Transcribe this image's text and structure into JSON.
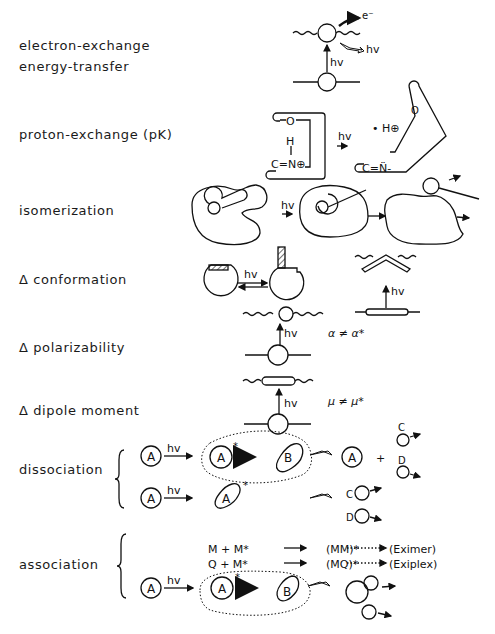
{
  "labels": {
    "electron_exchange": "electron-exchange",
    "energy_transfer": "energy-transfer",
    "proton_exchange": "proton-exchange (pK)",
    "isomerization": "isomerization",
    "conformation": "Δ conformation",
    "polarizability": "Δ polarizability",
    "dipole_moment": "Δ dipole moment",
    "dissociation": "dissociation",
    "association": "association"
  },
  "symbols": {
    "hv": "hv",
    "electron": "e⁻",
    "proton": "• H⊕",
    "O": "O",
    "H": "H",
    "CN_plus": "C=N⊕",
    "CN_lone": "C=N̈-",
    "alpha_neq": "α ≠ α*",
    "mu_neq": "μ ≠ μ*",
    "A": "A",
    "B": "B",
    "C": "C",
    "D": "D",
    "star": "*",
    "plus": "+"
  },
  "association_reactions": [
    {
      "reactants": "M  +  M*",
      "complex": "(MM)*",
      "product": "(Eximer)"
    },
    {
      "reactants": "Q  +  M*",
      "complex": "(MQ)*",
      "product": "(Exiplex)"
    }
  ]
}
